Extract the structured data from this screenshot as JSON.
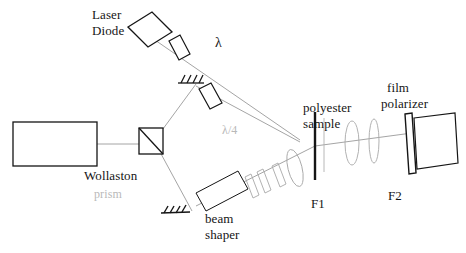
{
  "figure": {
    "type": "optical-setup-diagram",
    "background_color": "#ffffff",
    "stroke_color": "#1a1a1a",
    "beam_color": "#8a8a8a",
    "faint_color": "#bcbcbc",
    "width": 466,
    "height": 253
  },
  "labels": {
    "laser_diode_line1": "Laser",
    "laser_diode_line2": "Diode",
    "lambda": "λ",
    "quarter_wave": "λ/4",
    "wollaston_line1": "Wollaston",
    "wollaston_line2": "prism",
    "beam_shaper_line1": "beam",
    "beam_shaper_line2": "shaper",
    "polyester_line1": "polyester",
    "polyester_line2": "sample",
    "film_polarizer_line1": "film",
    "film_polarizer_line2": "polarizer",
    "f1": "F1",
    "f2": "F2"
  },
  "components": [
    {
      "name": "laser-diode",
      "label": "Laser Diode",
      "shape": "tilted-rectangle"
    },
    {
      "name": "half-wave-plate",
      "label": "λ",
      "shape": "tilted-plate"
    },
    {
      "name": "upper-mirror",
      "label": "",
      "shape": "hatched-mirror"
    },
    {
      "name": "quarter-wave-plate",
      "label": "λ/4",
      "shape": "tilted-plate"
    },
    {
      "name": "detector-box",
      "label": "",
      "shape": "rectangle"
    },
    {
      "name": "wollaston-prism",
      "label": "Wollaston prism",
      "shape": "square-with-diagonal"
    },
    {
      "name": "lower-mirror",
      "label": "",
      "shape": "hatched-mirror"
    },
    {
      "name": "beam-shaper",
      "label": "beam shaper",
      "shape": "tilted-rectangle"
    },
    {
      "name": "beam-shaper-plates",
      "label": "",
      "shape": "thin-plates"
    },
    {
      "name": "condenser-lens",
      "label": "",
      "shape": "lens-ellipse"
    },
    {
      "name": "polyester-sample",
      "label": "polyester sample",
      "shape": "vertical-slab"
    },
    {
      "name": "lens-f1",
      "label": "F1",
      "shape": "lens-ellipse"
    },
    {
      "name": "lens-f2",
      "label": "F2",
      "shape": "lens-ellipse"
    },
    {
      "name": "film-polarizer",
      "label": "film polarizer",
      "shape": "thick-plate"
    },
    {
      "name": "camera-body",
      "label": "",
      "shape": "tilted-rectangle"
    }
  ]
}
